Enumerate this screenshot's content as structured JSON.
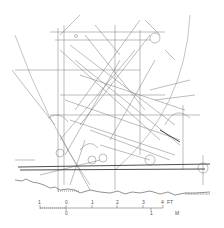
{
  "figure": {
    "type": "incised line drawing",
    "colors": {
      "line": "#6a6a6a",
      "heavy_line": "#3a3a3a",
      "background": "#ffffff"
    }
  },
  "scale_bar": {
    "feet_labels": [
      "1",
      "0",
      "1",
      "2",
      "3",
      "4"
    ],
    "feet_unit": "FT",
    "meter_labels": [
      "0",
      "1"
    ],
    "meter_unit": "M"
  }
}
